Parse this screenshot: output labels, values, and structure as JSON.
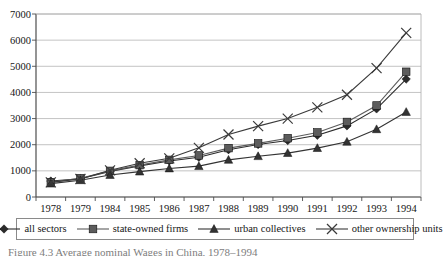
{
  "chart_data": {
    "type": "line",
    "title": "",
    "xlabel": "",
    "ylabel": "",
    "categories": [
      "1978",
      "1979",
      "1984",
      "1985",
      "1986",
      "1987",
      "1988",
      "1989",
      "1990",
      "1991",
      "1992",
      "1993",
      "1994"
    ],
    "ylim": [
      0,
      7000
    ],
    "ytick_labels": [
      "7000",
      "6000",
      "5000",
      "4000",
      "3000",
      "2000",
      "1000",
      "0"
    ],
    "ytick_values": [
      7000,
      6000,
      5000,
      4000,
      3000,
      2000,
      1000,
      0
    ],
    "grid": true,
    "legend_position": "bottom",
    "series": [
      {
        "name": "all sectors",
        "marker": "diamond",
        "color": "#2b2b2b",
        "values": [
          610,
          700,
          980,
          1190,
          1380,
          1520,
          1810,
          2010,
          2160,
          2360,
          2720,
          3370,
          4510
        ]
      },
      {
        "name": "state-owned firms",
        "marker": "square",
        "color": "#5c5c5c",
        "values": [
          570,
          720,
          1000,
          1220,
          1420,
          1590,
          1870,
          2050,
          2250,
          2470,
          2870,
          3500,
          4790
        ]
      },
      {
        "name": "urban collectives",
        "marker": "triangle",
        "color": "#333333",
        "values": [
          510,
          640,
          840,
          970,
          1090,
          1180,
          1420,
          1560,
          1680,
          1870,
          2110,
          2590,
          3250
        ]
      },
      {
        "name": "other ownership units",
        "marker": "cross",
        "color": "#3a3a3a",
        "values": [
          560,
          690,
          1020,
          1290,
          1480,
          1880,
          2390,
          2710,
          3000,
          3430,
          3910,
          4930,
          6280
        ]
      }
    ]
  },
  "legend": {
    "entries": [
      {
        "label": "all sectors",
        "marker": "diamond-marker-icon"
      },
      {
        "label": "state-owned firms",
        "marker": "square-marker-icon"
      },
      {
        "label": "urban collectives",
        "marker": "triangle-marker-icon"
      },
      {
        "label": "other ownership units",
        "marker": "cross-marker-icon"
      }
    ]
  },
  "caption": {
    "text": "Figure 4.3  Average nominal Wages in China, 1978–1994"
  },
  "colors": {
    "axis": "#4d4d4d",
    "grid": "#b4b4b4",
    "text": "#161616",
    "plot_background": "#ffffff"
  }
}
